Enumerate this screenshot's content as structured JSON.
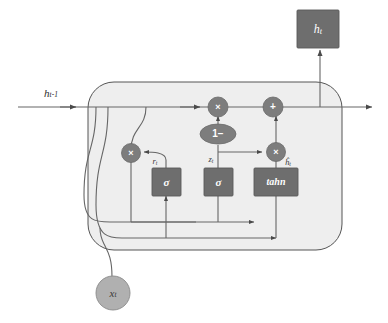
{
  "diagram": {
    "background_color": "#ffffff",
    "cell_fill": "#eeeeee",
    "node_fill": "#7d7d7d",
    "gate_fill": "#6e6e6e",
    "input_fill": "#b0b0b0",
    "wire_color": "#666666"
  },
  "inputs": {
    "prev_state": {
      "label": "h",
      "subscript": "t-1",
      "name": "previous hidden state"
    },
    "data_input": {
      "label": "x",
      "subscript": "t",
      "name": "input vector"
    }
  },
  "outputs": {
    "hidden_state_box": {
      "label": "h",
      "subscript": "t",
      "name": "hidden state output"
    }
  },
  "operators": [
    {
      "id": "mul-reset",
      "symbol": "×",
      "name": "reset multiply"
    },
    {
      "id": "mul-update",
      "symbol": "×",
      "name": "update multiply"
    },
    {
      "id": "mul-candidate",
      "symbol": "×",
      "name": "candidate multiply"
    },
    {
      "id": "add-output",
      "symbol": "+",
      "name": "add"
    },
    {
      "id": "one-minus",
      "symbol": "1−",
      "name": "one minus"
    }
  ],
  "gates": [
    {
      "id": "gate-reset",
      "label": "σ",
      "signal": "r",
      "signal_sub": "t",
      "name": "reset gate"
    },
    {
      "id": "gate-update",
      "label": "σ",
      "signal": "z",
      "signal_sub": "t",
      "name": "update gate"
    },
    {
      "id": "gate-candidate",
      "label": "tahn",
      "signal": "ĥ",
      "signal_sub": "t",
      "name": "candidate activation"
    }
  ],
  "signal_labels": {
    "reset": {
      "base": "r",
      "sub": "t"
    },
    "update": {
      "base": "z",
      "sub": "t"
    },
    "candidate": {
      "base": "ĥ",
      "sub": "t"
    }
  }
}
